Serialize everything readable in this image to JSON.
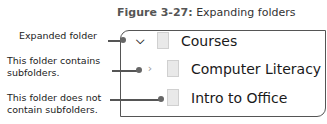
{
  "caption": {
    "number": "Figure 3-27:",
    "title": "Expanding folders"
  },
  "tree": [
    {
      "name": "Courses",
      "state": "expanded",
      "chevron": "chevron-down",
      "icon": "folder-icon"
    },
    {
      "name": "Computer Literacy",
      "state": "collapsed",
      "chevron": "chevron-right",
      "icon": "folder-icon"
    },
    {
      "name": "Intro to Office",
      "state": "no-children",
      "chevron": "",
      "icon": "folder-icon"
    }
  ],
  "callouts": [
    {
      "text": "Expanded folder"
    },
    {
      "line1": "This folder contains",
      "line2": "subfolders."
    },
    {
      "line1": "This folder does not",
      "line2": "contain subfolders."
    }
  ]
}
